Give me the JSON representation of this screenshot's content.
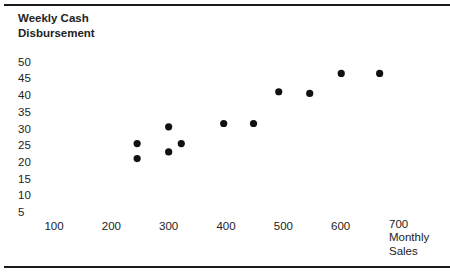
{
  "chart_data": {
    "type": "scatter",
    "title": "",
    "xlabel": "Monthly Sales",
    "ylabel": "Weekly Cash Disbursement",
    "xlabel_lines": [
      "Monthly",
      "Sales"
    ],
    "ylabel_lines": [
      "Weekly Cash",
      "Disbursement"
    ],
    "x_ticks": [
      100,
      200,
      300,
      400,
      500,
      600,
      700
    ],
    "y_ticks": [
      50,
      45,
      40,
      35,
      30,
      25,
      20,
      15,
      10,
      5
    ],
    "xlim": [
      100,
      700
    ],
    "ylim": [
      5,
      50
    ],
    "grid": false,
    "legend": null,
    "marker_color": "#111111",
    "points": [
      {
        "x": 245,
        "y": 25.5
      },
      {
        "x": 245,
        "y": 21
      },
      {
        "x": 300,
        "y": 30.5
      },
      {
        "x": 300,
        "y": 23
      },
      {
        "x": 322,
        "y": 25.5
      },
      {
        "x": 396,
        "y": 31.5
      },
      {
        "x": 448,
        "y": 31.5
      },
      {
        "x": 492,
        "y": 41
      },
      {
        "x": 546,
        "y": 40.5
      },
      {
        "x": 601,
        "y": 46.5
      },
      {
        "x": 668,
        "y": 46.5
      }
    ]
  }
}
